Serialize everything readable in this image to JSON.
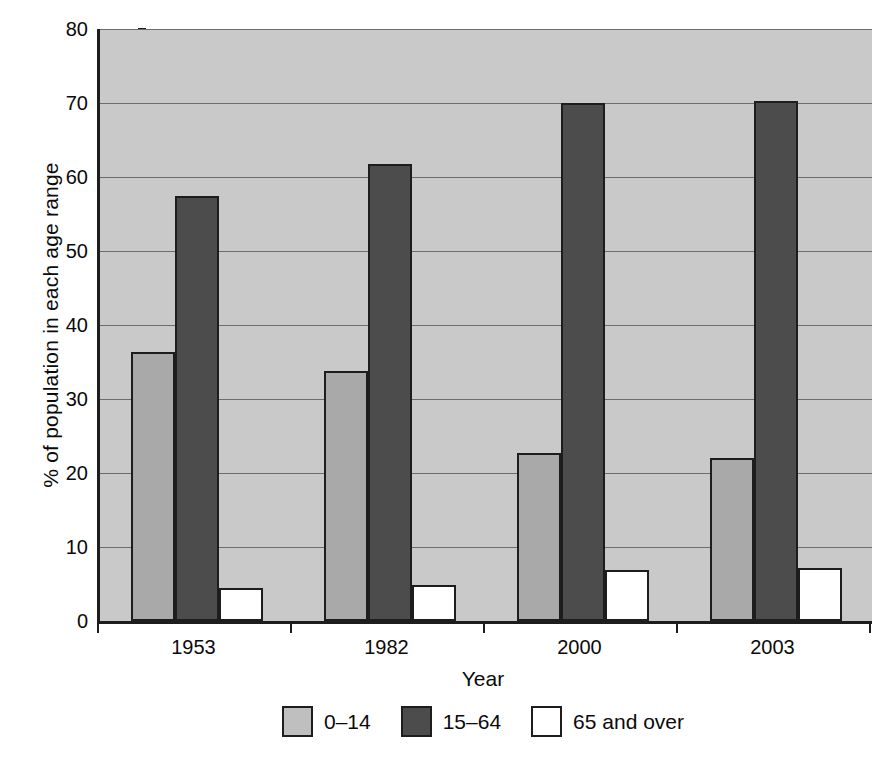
{
  "chart_data": {
    "type": "bar",
    "title": "",
    "subtitle": "",
    "xlabel": "Year",
    "ylabel": "% of population in each age range",
    "categories": [
      "1953",
      "1982",
      "2000",
      "2003"
    ],
    "series": [
      {
        "name": "0–14",
        "color": "#a9a9a9",
        "values": [
          36.3,
          33.8,
          22.7,
          22.0
        ]
      },
      {
        "name": "15–64",
        "color": "#4c4c4c",
        "values": [
          57.4,
          61.7,
          70.0,
          70.3
        ]
      },
      {
        "name": "65 and over",
        "color": "#ffffff",
        "values": [
          4.5,
          4.8,
          6.9,
          7.2
        ]
      }
    ],
    "ylim": [
      0,
      80
    ],
    "ytick_values": [
      0,
      10,
      20,
      30,
      40,
      50,
      60,
      70,
      80
    ],
    "ytick_labels": [
      "0",
      "10",
      "20",
      "30",
      "40",
      "50",
      "60",
      "70",
      "80"
    ],
    "grid": true,
    "grid_axis": "y",
    "legend_position": "bottom",
    "plot_background": "#c9c9c9",
    "axis_color": "#1d1d1d",
    "gridline_color": "#6d6d6d"
  },
  "legend": {
    "items": [
      {
        "label": "0–14",
        "swatch": "legend-swatch-0-14"
      },
      {
        "label": "15–64",
        "swatch": "legend-swatch-15-64"
      },
      {
        "label": "65 and over",
        "swatch": "legend-swatch-65-and-over"
      }
    ]
  }
}
